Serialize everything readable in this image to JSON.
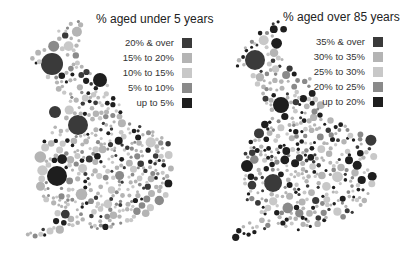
{
  "maps": [
    {
      "title": "% aged under 5 years",
      "legend": [
        {
          "label": "20% & over",
          "color": "#3a3a3a"
        },
        {
          "label": "15% to 20%",
          "color": "#b4b4b4"
        },
        {
          "label": "10% to 15%",
          "color": "#c8c8c8"
        },
        {
          "label": "5% to 10%",
          "color": "#8a8a8a"
        },
        {
          "label": "up to 5%",
          "color": "#1e1e1e"
        }
      ],
      "seed": 7,
      "weights": [
        0.12,
        0.35,
        0.28,
        0.13,
        0.12
      ]
    },
    {
      "title": "% aged over 85 years",
      "legend": [
        {
          "label": "35% & over",
          "color": "#3a3a3a"
        },
        {
          "label": "30% to 35%",
          "color": "#b4b4b4"
        },
        {
          "label": "25% to 30%",
          "color": "#c8c8c8"
        },
        {
          "label": "20% to 25%",
          "color": "#8a8a8a"
        },
        {
          "label": "up to 20%",
          "color": "#1e1e1e"
        }
      ],
      "seed": 23,
      "weights": [
        0.1,
        0.3,
        0.22,
        0.13,
        0.25
      ]
    }
  ]
}
